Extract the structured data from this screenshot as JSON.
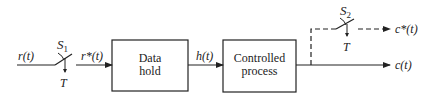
{
  "diagram": {
    "type": "sampled-data control system block diagram",
    "signals": {
      "input": "r(t)",
      "sampled_input": "r*(t)",
      "hold_output": "h(t)",
      "output": "c(t)",
      "sampled_output": "c*(t)"
    },
    "switches": [
      {
        "id": "S1",
        "label": "S",
        "subscript": "1",
        "period_label": "T"
      },
      {
        "id": "S2",
        "label": "S",
        "subscript": "2",
        "period_label": "T"
      }
    ],
    "blocks": [
      {
        "id": "data-hold",
        "line1": "Data",
        "line2": "hold"
      },
      {
        "id": "controlled-process",
        "line1": "Controlled",
        "line2": "process"
      }
    ],
    "colors": {
      "line": "#222222",
      "background": "#ffffff"
    }
  }
}
